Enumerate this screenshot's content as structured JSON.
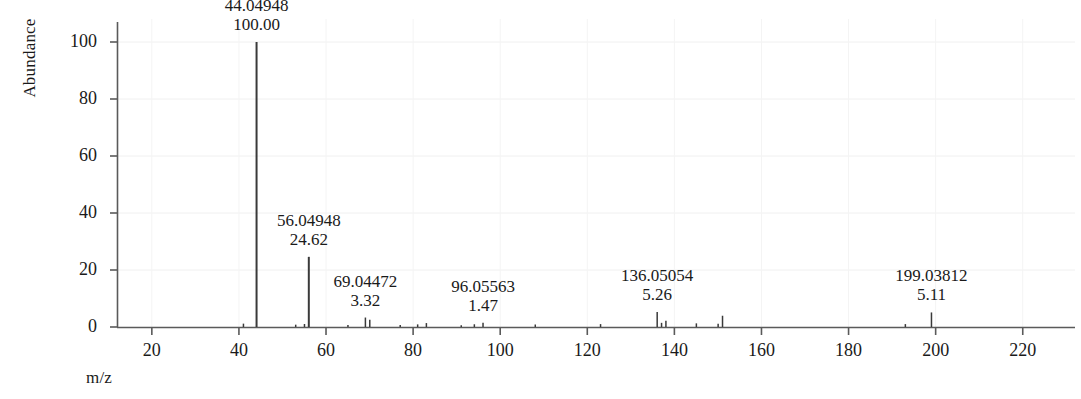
{
  "chart_data": {
    "type": "bar",
    "title": "",
    "xlabel": "m/z",
    "ylabel": "Abundance",
    "xlim": [
      12,
      232
    ],
    "ylim": [
      0,
      108
    ],
    "grid": false,
    "legend_position": "none",
    "xticks": [
      20,
      40,
      60,
      80,
      100,
      120,
      140,
      160,
      180,
      200,
      220
    ],
    "yticks": [
      0,
      20,
      40,
      60,
      80,
      100
    ],
    "x": [
      41.03858,
      44.04948,
      53.03858,
      55.05423,
      56.04948,
      65.03858,
      69.04472,
      70.05037,
      77.03858,
      81.04472,
      83.04948,
      91.05423,
      94.06513,
      96.05563,
      108.05563,
      123.04472,
      136.05054,
      137.05389,
      138.05543,
      145.04948,
      150.04659,
      151.05442,
      193.04256,
      199.03812
    ],
    "values": [
      1.18,
      100.0,
      0.82,
      1.05,
      24.62,
      0.74,
      3.32,
      2.55,
      0.68,
      0.92,
      1.38,
      0.61,
      0.96,
      1.47,
      0.88,
      1.02,
      5.26,
      1.46,
      2.21,
      1.28,
      1.18,
      3.95,
      1.02,
      5.11
    ],
    "annotations": [
      {
        "mz": "44.04948",
        "abundance": "100.00",
        "x": 44.04948,
        "y": 100.0
      },
      {
        "mz": "56.04948",
        "abundance": "24.62",
        "x": 56.04948,
        "y": 24.62
      },
      {
        "mz": "69.04472",
        "abundance": "3.32",
        "x": 69.04472,
        "y": 3.32
      },
      {
        "mz": "96.05563",
        "abundance": "1.47",
        "x": 96.05563,
        "y": 1.47
      },
      {
        "mz": "136.05054",
        "abundance": "5.26",
        "x": 136.05054,
        "y": 5.26
      },
      {
        "mz": "199.03812",
        "abundance": "5.11",
        "x": 199.03812,
        "y": 5.11
      }
    ],
    "axis_color": "#5a5a5a",
    "series_color": "#3a3a3a"
  }
}
